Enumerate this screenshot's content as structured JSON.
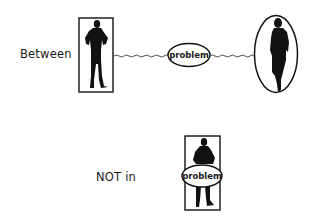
{
  "diagram": {
    "top_row": {
      "label": "Between",
      "left_figure": "man-silhouette-in-rectangle",
      "middle_node": "problem",
      "right_figure": "woman-silhouette-in-ellipse",
      "connector": "wavy-line"
    },
    "bottom_row": {
      "label": "NOT in",
      "figure": "man-silhouette-in-rectangle",
      "overlay_node": "problem"
    }
  },
  "colors": {
    "ink": "#111111",
    "background": "#ffffff"
  }
}
